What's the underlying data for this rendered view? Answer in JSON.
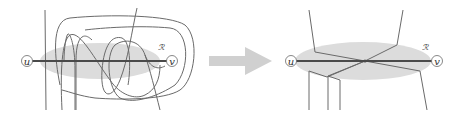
{
  "left_panel": {
    "node_u": "u",
    "node_v": "v",
    "region_label": "ℛ"
  },
  "arrow": {
    "direction": "right",
    "color": "#d0d0d0"
  },
  "right_panel": {
    "node_u": "u",
    "node_v": "v",
    "region_label": "ℛ"
  },
  "colors": {
    "region": "#dcdcdc",
    "edge": "#4a4a4a",
    "curves": "#6a6a6a"
  }
}
